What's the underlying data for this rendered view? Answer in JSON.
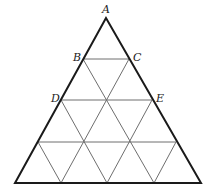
{
  "diagram": {
    "type": "triangular-grid",
    "subdivisions": 4,
    "colors": {
      "outline": "#1a1a1a",
      "grid": "#6e6e6e",
      "label": "#222222"
    },
    "vertices": {
      "apex": [
        106,
        18
      ],
      "bottom_left": [
        15,
        183
      ],
      "bottom_right": [
        201,
        183
      ]
    },
    "labels": [
      {
        "id": "A",
        "text": "A",
        "x": 102,
        "y": 13
      },
      {
        "id": "B",
        "text": "B",
        "x": 73,
        "y": 61
      },
      {
        "id": "C",
        "text": "C",
        "x": 133,
        "y": 61
      },
      {
        "id": "D",
        "text": "D",
        "x": 51,
        "y": 102
      },
      {
        "id": "E",
        "text": "E",
        "x": 156,
        "y": 102
      }
    ],
    "horizontal_lines": [
      {
        "name": "BC",
        "x1": 83,
        "y": 59,
        "x2": 129
      },
      {
        "name": "DE",
        "x1": 61,
        "y": 100,
        "x2": 152
      },
      {
        "name": "row3",
        "x1": 38,
        "y": 142,
        "x2": 176
      }
    ],
    "diagonals_down_right": [
      {
        "x1": 83,
        "y1": 59,
        "x2": 154,
        "y2": 183
      },
      {
        "x1": 61,
        "y1": 100,
        "x2": 107,
        "y2": 183
      },
      {
        "x1": 38,
        "y1": 142,
        "x2": 61,
        "y2": 183
      }
    ],
    "diagonals_down_left": [
      {
        "x1": 129,
        "y1": 59,
        "x2": 61,
        "y2": 183
      },
      {
        "x1": 152,
        "y1": 100,
        "x2": 107,
        "y2": 183
      },
      {
        "x1": 176,
        "y1": 142,
        "x2": 154,
        "y2": 183
      }
    ]
  }
}
